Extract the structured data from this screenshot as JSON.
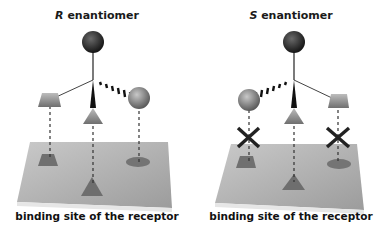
{
  "panels": [
    {
      "id": "left",
      "title_letter": "R",
      "title_rest": " enantiomer",
      "caption": "binding site of the receptor",
      "fits": [
        true,
        true,
        true
      ]
    },
    {
      "id": "right",
      "title_letter": "S",
      "title_rest": " enantiomer",
      "caption": "binding site of the receptor",
      "fits": [
        false,
        true,
        false
      ]
    }
  ],
  "colors": {
    "top_sphere": "#2b2b2b",
    "side_sphere": "#8a8a8a",
    "platform": "#b3b3b3",
    "site": "#777777",
    "cross": "#222222"
  },
  "icons": [
    "top-sphere-icon",
    "side-sphere-icon",
    "trapezoid-group-icon",
    "triangle-group-icon",
    "cross-mismatch-icon"
  ]
}
